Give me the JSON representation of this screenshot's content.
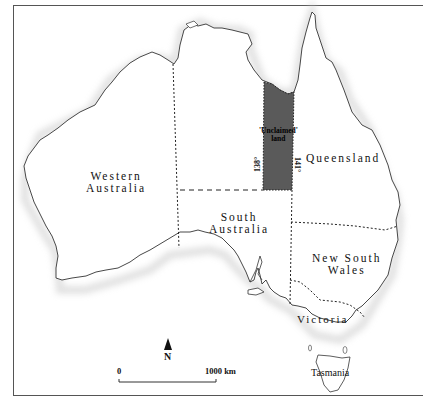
{
  "map": {
    "regions": [
      {
        "id": "western-australia",
        "lines": [
          "Western",
          "Australia"
        ]
      },
      {
        "id": "south-australia",
        "lines": [
          "South",
          "Australia"
        ]
      },
      {
        "id": "queensland",
        "lines": [
          "Queensland"
        ]
      },
      {
        "id": "new-south-wales",
        "lines": [
          "New South",
          "Wales"
        ]
      },
      {
        "id": "victoria",
        "lines": [
          "Victoria"
        ]
      },
      {
        "id": "tasmania",
        "lines": [
          "Tasmania"
        ]
      }
    ],
    "unclaimed": {
      "lines": [
        "'Unclaimed'",
        "land"
      ],
      "west_longitude": "138°",
      "east_longitude": "141°",
      "fill_color": "#5a5a5a"
    },
    "north_arrow": {
      "label": "N"
    },
    "scale_bar": {
      "start_label": "0",
      "end_label": "1000 km"
    },
    "colors": {
      "coast": "#333333",
      "border": "#222222",
      "shade": "#d8d8d8"
    }
  }
}
